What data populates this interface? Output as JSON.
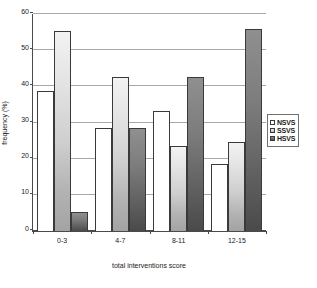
{
  "chart_data": {
    "type": "bar",
    "title": "",
    "subtitle": "",
    "xlabel": "total interventions score",
    "ylabel": "frequency (%)",
    "categories": [
      "0-3",
      "4-7",
      "8-11",
      "12-15"
    ],
    "series": [
      {
        "name": "NSVS",
        "values": [
          38.7,
          28.5,
          33.1,
          18.5
        ]
      },
      {
        "name": "SSVS",
        "values": [
          55.4,
          42.6,
          23.5,
          24.6
        ]
      },
      {
        "name": "HSVS",
        "values": [
          5.3,
          28.5,
          42.6,
          55.8
        ]
      }
    ],
    "ylim": [
      0,
      60
    ],
    "yticks": [
      0,
      10,
      20,
      30,
      40,
      50,
      60
    ],
    "ytick_labels": [
      "0",
      "10",
      "20",
      "30",
      "40",
      "50",
      "60"
    ],
    "grid": true,
    "grid_axis": "y",
    "legend_position": "right",
    "annotations": []
  },
  "legend": {
    "entries": [
      {
        "label": "NSVS",
        "swatch": "legend-swatch-nsvs"
      },
      {
        "label": "SSVS",
        "swatch": "legend-swatch-ssvs"
      },
      {
        "label": "HSVS",
        "swatch": "legend-swatch-hsvs"
      }
    ]
  }
}
